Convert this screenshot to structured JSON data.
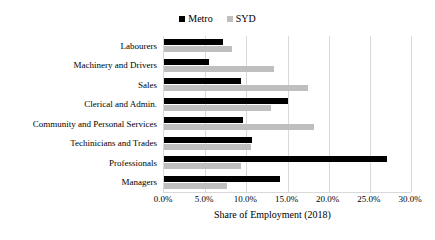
{
  "chart_data": {
    "type": "bar",
    "orientation": "horizontal",
    "title": "",
    "xlabel": "Share of Employment (2018)",
    "ylabel": "",
    "xlim": [
      0,
      30
    ],
    "xtick_labels": [
      "0.0%",
      "5.0%",
      "10.0%",
      "15.0%",
      "20.0%",
      "25.0%",
      "30.0%"
    ],
    "xtick_values": [
      0,
      5,
      10,
      15,
      20,
      25,
      30
    ],
    "grid": true,
    "legend_position": "top-center",
    "categories": [
      "Labourers",
      "Machinery and Drivers",
      "Sales",
      "Clerical and Admin.",
      "Community and Personal Services",
      "Techinicians and Trades",
      "Professionals",
      "Managers"
    ],
    "series": [
      {
        "name": "Metro",
        "color": "#000000",
        "values": [
          7.2,
          5.5,
          9.4,
          15.1,
          9.6,
          10.7,
          27.1,
          14.1
        ]
      },
      {
        "name": "SYD",
        "color": "#bfbfbf",
        "values": [
          8.2,
          13.3,
          17.5,
          13.0,
          18.2,
          10.6,
          9.4,
          7.6
        ]
      }
    ]
  },
  "legend": {
    "items": [
      {
        "label": "Metro",
        "color": "#000000",
        "icon": "square-marker-icon"
      },
      {
        "label": "SYD",
        "color": "#bfbfbf",
        "icon": "square-marker-icon"
      }
    ]
  },
  "axis": {
    "x_title": "Share of Employment (2018)"
  }
}
